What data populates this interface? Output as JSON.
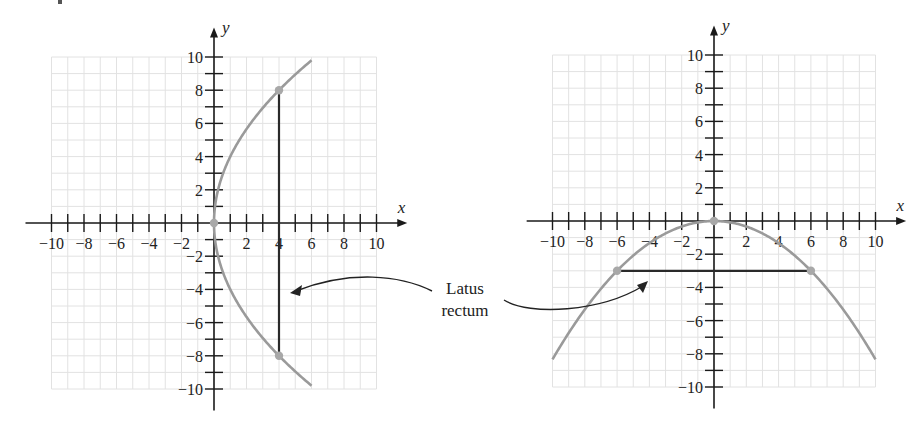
{
  "chart_data": [
    {
      "type": "line",
      "title": "",
      "equation_implied": "y^2 = 16x",
      "xlabel": "x",
      "ylabel": "y",
      "xlim": [
        -10,
        10
      ],
      "ylim": [
        -10,
        10
      ],
      "grid": true,
      "x_ticks": [
        -10,
        -8,
        -6,
        -4,
        -2,
        2,
        4,
        6,
        8,
        10
      ],
      "y_ticks": [
        -10,
        -8,
        -6,
        -4,
        -2,
        2,
        4,
        6,
        8,
        10
      ],
      "series": [
        {
          "name": "parabola",
          "color": "#9a9a9a",
          "points": [
            [
              6,
              9.8
            ],
            [
              4,
              8
            ],
            [
              2,
              5.66
            ],
            [
              1,
              4
            ],
            [
              0.25,
              2
            ],
            [
              0,
              0
            ],
            [
              0.25,
              -2
            ],
            [
              1,
              -4
            ],
            [
              2,
              -5.66
            ],
            [
              4,
              -8
            ],
            [
              6,
              -9.8
            ]
          ]
        },
        {
          "name": "latus rectum",
          "color": "#2a2a2a",
          "points": [
            [
              4,
              8
            ],
            [
              4,
              -8
            ]
          ]
        }
      ],
      "marked_points": [
        [
          0,
          0
        ],
        [
          4,
          8
        ],
        [
          4,
          -8
        ]
      ]
    },
    {
      "type": "line",
      "title": "",
      "equation_implied": "x^2 = -12y",
      "xlabel": "x",
      "ylabel": "y",
      "xlim": [
        -10,
        10
      ],
      "ylim": [
        -10,
        10
      ],
      "grid": true,
      "x_ticks": [
        -10,
        -8,
        -6,
        -4,
        -2,
        2,
        4,
        6,
        8,
        10
      ],
      "y_ticks": [
        -10,
        -8,
        -6,
        -4,
        -2,
        2,
        4,
        6,
        8,
        10
      ],
      "series": [
        {
          "name": "parabola",
          "color": "#9a9a9a",
          "points": [
            [
              -10,
              -8.33
            ],
            [
              -8,
              -5.33
            ],
            [
              -6,
              -3
            ],
            [
              -4,
              -1.33
            ],
            [
              -2,
              -0.33
            ],
            [
              0,
              0
            ],
            [
              2,
              -0.33
            ],
            [
              4,
              -1.33
            ],
            [
              6,
              -3
            ],
            [
              8,
              -5.33
            ],
            [
              10,
              -8.33
            ]
          ]
        },
        {
          "name": "latus rectum",
          "color": "#2a2a2a",
          "points": [
            [
              -6,
              -3
            ],
            [
              6,
              -3
            ]
          ]
        }
      ],
      "marked_points": [
        [
          0,
          0
        ],
        [
          -6,
          -3
        ],
        [
          6,
          -3
        ]
      ]
    }
  ],
  "labels": {
    "x_axis": "x",
    "y_axis": "y",
    "callout_line1": "Latus",
    "callout_line2": "rectum"
  }
}
